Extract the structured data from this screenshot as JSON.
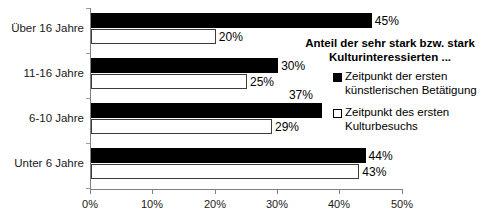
{
  "chart_data": {
    "type": "bar",
    "orientation": "horizontal",
    "title": "Anteil der sehr stark bzw. stark Kulturinteressierten ...",
    "categories": [
      "Über 16 Jahre",
      "11-16 Jahre",
      "6-10 Jahre",
      "Unter 6 Jahre"
    ],
    "series": [
      {
        "name": "Zeitpunkt der ersten künstlerischen Betätigung",
        "name_line1": "Zeitpunkt der ersten",
        "name_line2": "künstlerischen Betätigung",
        "color": "#000000",
        "style": "filled",
        "values": [
          45,
          30,
          37,
          44
        ],
        "labels": [
          "45%",
          "30%",
          "37%",
          "44%"
        ]
      },
      {
        "name": "Zeitpunkt des ersten Kulturbesuchs",
        "name_line1": "Zeitpunkt des ersten",
        "name_line2": "Kulturbesuchs",
        "color": "#ffffff",
        "style": "open",
        "values": [
          20,
          25,
          29,
          43
        ],
        "labels": [
          "20%",
          "25%",
          "29%",
          "43%"
        ]
      }
    ],
    "xlabel": "",
    "ylabel": "",
    "xlim": [
      0,
      50
    ],
    "xticks": [
      0,
      10,
      20,
      30,
      40,
      50
    ],
    "xtick_labels": [
      "0%",
      "10%",
      "20%",
      "30%",
      "40%",
      "50%"
    ],
    "grid": false,
    "legend_position": "upper-right-inside",
    "title_lines": [
      "Anteil der sehr stark bzw. stark",
      "Kulturinteressierten ..."
    ]
  }
}
